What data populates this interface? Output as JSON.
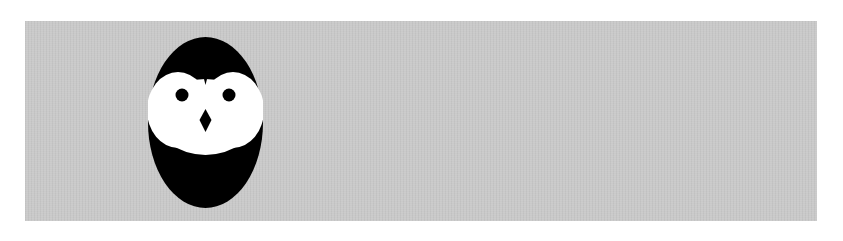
{
  "canvas": {
    "background": "#ffffff",
    "panel_color": "#c9c9c9"
  },
  "logo": {
    "icon": "owl-icon",
    "body_color": "#000000",
    "face_color": "#ffffff",
    "eye_color": "#000000",
    "beak_color": "#000000"
  }
}
